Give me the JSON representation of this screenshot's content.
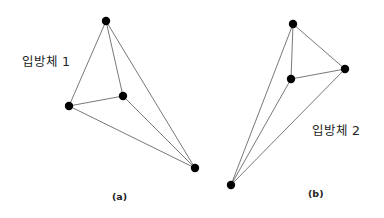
{
  "figures": [
    {
      "id": "a",
      "title": "입방체 1",
      "caption": "(a)",
      "title_pos": {
        "x": 22,
        "y": 51
      },
      "caption_pos": {
        "x": 112,
        "y": 191
      },
      "nodes": [
        {
          "name": "top",
          "x": 106,
          "y": 21
        },
        {
          "name": "left",
          "x": 69,
          "y": 106
        },
        {
          "name": "middle",
          "x": 123,
          "y": 96
        },
        {
          "name": "bottom-right",
          "x": 195,
          "y": 168
        }
      ],
      "edges": [
        [
          "top",
          "left"
        ],
        [
          "top",
          "middle"
        ],
        [
          "top",
          "bottom-right"
        ],
        [
          "left",
          "middle"
        ],
        [
          "left",
          "bottom-right"
        ],
        [
          "middle",
          "bottom-right"
        ]
      ]
    },
    {
      "id": "b",
      "title": "입방체 2",
      "caption": "(b)",
      "title_pos": {
        "x": 312,
        "y": 120
      },
      "caption_pos": {
        "x": 308,
        "y": 188
      },
      "nodes": [
        {
          "name": "top",
          "x": 293,
          "y": 24
        },
        {
          "name": "right",
          "x": 345,
          "y": 69
        },
        {
          "name": "middle",
          "x": 291,
          "y": 79
        },
        {
          "name": "bottom",
          "x": 231,
          "y": 185
        }
      ],
      "edges": [
        [
          "top",
          "middle"
        ],
        [
          "top",
          "right"
        ],
        [
          "middle",
          "right"
        ],
        [
          "bottom",
          "top"
        ],
        [
          "bottom",
          "middle"
        ],
        [
          "bottom",
          "right"
        ]
      ]
    }
  ],
  "style": {
    "node_color": "#000000",
    "edge_color": "#555555",
    "node_radius": 4.2
  }
}
